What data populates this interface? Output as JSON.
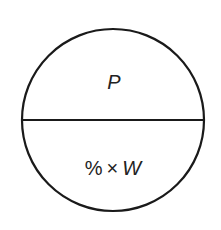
{
  "diagram": {
    "shape": "circle divided horizontally into two halves",
    "top_label": "P",
    "bottom_label": {
      "percent": "%",
      "times": "×",
      "variable": "W"
    },
    "stroke_color": "#1a1a1a",
    "text_color": "#222222",
    "background": "#ffffff"
  }
}
